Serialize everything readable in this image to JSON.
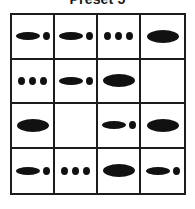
{
  "title": "Preset 5",
  "grid": {
    "rows": 4,
    "columns": 4,
    "border_color": "#1c1c1c",
    "blob_color": "#111111",
    "background_color": "#ffffff",
    "cells": [
      {
        "row": 1,
        "col": 1,
        "pattern": "ellipse-plus-dot",
        "shapes": [
          "ellipse-medium",
          "dot-small"
        ]
      },
      {
        "row": 1,
        "col": 2,
        "pattern": "ellipse-plus-dot",
        "shapes": [
          "ellipse-medium",
          "dot-small"
        ]
      },
      {
        "row": 1,
        "col": 3,
        "pattern": "three-dots",
        "shapes": [
          "dot-small",
          "dot-small",
          "dot-small"
        ]
      },
      {
        "row": 1,
        "col": 4,
        "pattern": "single-large-ellipse",
        "shapes": [
          "ellipse-large"
        ]
      },
      {
        "row": 2,
        "col": 1,
        "pattern": "three-dots",
        "shapes": [
          "dot-small",
          "dot-small",
          "dot-small"
        ]
      },
      {
        "row": 2,
        "col": 2,
        "pattern": "ellipse-plus-dot",
        "shapes": [
          "ellipse-medium",
          "dot-small"
        ]
      },
      {
        "row": 2,
        "col": 3,
        "pattern": "single-large-ellipse",
        "shapes": [
          "ellipse-large"
        ]
      },
      {
        "row": 2,
        "col": 4,
        "pattern": "empty",
        "shapes": []
      },
      {
        "row": 3,
        "col": 1,
        "pattern": "single-large-ellipse",
        "shapes": [
          "ellipse-large"
        ]
      },
      {
        "row": 3,
        "col": 2,
        "pattern": "empty",
        "shapes": []
      },
      {
        "row": 3,
        "col": 3,
        "pattern": "ellipse-plus-dot",
        "shapes": [
          "ellipse-medium",
          "dot-small"
        ]
      },
      {
        "row": 3,
        "col": 4,
        "pattern": "single-large-ellipse",
        "shapes": [
          "ellipse-large"
        ]
      },
      {
        "row": 4,
        "col": 1,
        "pattern": "ellipse-plus-dot",
        "shapes": [
          "ellipse-medium",
          "dot-small"
        ]
      },
      {
        "row": 4,
        "col": 2,
        "pattern": "three-dots",
        "shapes": [
          "dot-small",
          "dot-small",
          "dot-small"
        ]
      },
      {
        "row": 4,
        "col": 3,
        "pattern": "single-large-ellipse",
        "shapes": [
          "ellipse-large"
        ]
      },
      {
        "row": 4,
        "col": 4,
        "pattern": "ellipse-plus-dot",
        "shapes": [
          "ellipse-medium",
          "dot-small"
        ]
      }
    ]
  }
}
